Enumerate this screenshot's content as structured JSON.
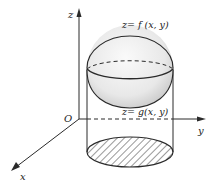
{
  "figure": {
    "type": "3d-solid-diagram",
    "axes": {
      "x_label": "x",
      "y_label": "y",
      "z_label": "z",
      "origin_label": "O"
    },
    "surfaces": {
      "upper_label": "z= f (x, y)",
      "lower_label": "z= g(x, y)"
    },
    "colors": {
      "line": "#2a2a2a",
      "sphere_fill": "#e6e6e6",
      "hatch": "#333333",
      "background": "#ffffff"
    }
  }
}
